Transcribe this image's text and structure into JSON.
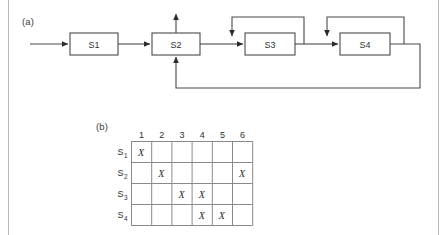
{
  "figure": {
    "panel_a_label": "(a)",
    "panel_b_label": "(b)"
  },
  "block_diagram": {
    "blocks": [
      {
        "id": "S1",
        "label": "S1",
        "x": 70,
        "y": 33,
        "w": 48,
        "h": 22
      },
      {
        "id": "S2",
        "label": "S2",
        "x": 152,
        "y": 33,
        "w": 48,
        "h": 22
      },
      {
        "id": "S3",
        "label": "S3",
        "x": 245,
        "y": 33,
        "w": 50,
        "h": 22
      },
      {
        "id": "S4",
        "label": "S4",
        "x": 340,
        "y": 33,
        "w": 50,
        "h": 22
      }
    ],
    "connections": [
      {
        "name": "input-to-s1",
        "from": "input",
        "to": "S1"
      },
      {
        "name": "s1-to-s2",
        "from": "S1",
        "to": "S2"
      },
      {
        "name": "s2-output-up",
        "from": "S2",
        "to": "output-top"
      },
      {
        "name": "s2-to-s3",
        "from": "S2",
        "to": "S3"
      },
      {
        "name": "s3-feedback-to-s3-input",
        "from": "S3",
        "to": "S3"
      },
      {
        "name": "s3-to-s4",
        "from": "S3",
        "to": "S4"
      },
      {
        "name": "s4-feedback-to-s4-input",
        "from": "S4",
        "to": "S4"
      },
      {
        "name": "s4-feedback-to-s2",
        "from": "S4",
        "to": "S2"
      }
    ]
  },
  "matrix": {
    "column_headers": [
      "1",
      "2",
      "3",
      "4",
      "5",
      "6"
    ],
    "row_headers": [
      {
        "base": "S",
        "sub": "1"
      },
      {
        "base": "S",
        "sub": "2"
      },
      {
        "base": "S",
        "sub": "3"
      },
      {
        "base": "S",
        "sub": "4"
      }
    ],
    "mark": "X",
    "cells": [
      [
        true,
        false,
        false,
        false,
        false,
        false
      ],
      [
        false,
        true,
        false,
        false,
        false,
        true
      ],
      [
        false,
        false,
        true,
        true,
        false,
        false
      ],
      [
        false,
        false,
        false,
        true,
        true,
        false
      ]
    ]
  },
  "colors": {
    "line": "#4a4a4a",
    "grid": "#8a8a8a",
    "text": "#303030",
    "border": "#b8b8b8",
    "background": "#ffffff"
  }
}
